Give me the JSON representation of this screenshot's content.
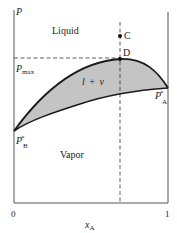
{
  "diagram": {
    "type": "pressure-composition phase diagram",
    "axes": {
      "y_label": "P",
      "x_label_main": "x",
      "x_label_sub": "A",
      "x_tick_min": "0",
      "x_tick_max": "1"
    },
    "regions": {
      "liquid": "Liquid",
      "vapor": "Vapor",
      "two_phase_main": "l",
      "two_phase_plus": "+",
      "two_phase_v": "v"
    },
    "points": {
      "c": "C",
      "d": "D"
    },
    "pressures": {
      "pmax_main": "P",
      "pmax_sub": "max",
      "pa_main": "P",
      "pa_sup": "*",
      "pa_sub": "A",
      "pb_main": "P",
      "pb_sup": "*",
      "pb_sub": "B"
    },
    "colors": {
      "two_phase_fill": "#c4c4c4",
      "line": "#1a1a1a",
      "axis": "#555555"
    }
  }
}
